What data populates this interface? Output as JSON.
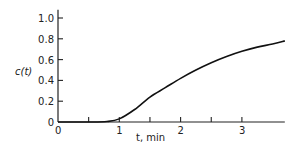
{
  "chart_data": {
    "type": "line",
    "title": "",
    "xlabel": "t, min",
    "ylabel": "c(t)",
    "xlim": [
      0,
      3.7
    ],
    "ylim": [
      0,
      1.0
    ],
    "x_ticks": [
      0,
      0.5,
      1,
      1.5,
      2,
      2.5,
      3
    ],
    "x_tick_labels": [
      "0",
      "",
      "1",
      "",
      "2",
      "",
      "3"
    ],
    "y_ticks": [
      0,
      0.2,
      0.4,
      0.6,
      0.8,
      1.0
    ],
    "y_tick_labels": [
      "0",
      "0.2",
      "0.4",
      "0.6",
      "0.8",
      "1.0"
    ],
    "grid": false,
    "legend": null,
    "series": [
      {
        "name": "c(t)",
        "x": [
          0,
          0.5,
          0.8,
          1.0,
          1.25,
          1.5,
          1.75,
          2.0,
          2.25,
          2.5,
          2.75,
          3.0,
          3.25,
          3.5,
          3.7
        ],
        "y": [
          0,
          0,
          0.005,
          0.03,
          0.12,
          0.24,
          0.33,
          0.42,
          0.5,
          0.57,
          0.63,
          0.68,
          0.72,
          0.75,
          0.78
        ]
      }
    ]
  }
}
